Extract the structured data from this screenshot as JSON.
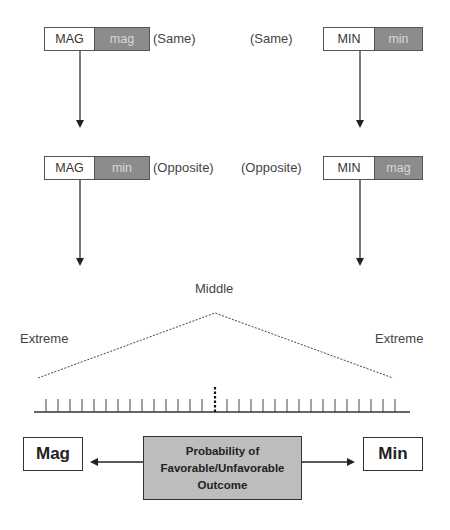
{
  "row1": {
    "left": {
      "upper": "MAG",
      "lower": "mag",
      "relation": "(Same)"
    },
    "right": {
      "upper": "MIN",
      "lower": "min",
      "relation": "(Same)"
    }
  },
  "row2": {
    "left": {
      "upper": "MAG",
      "lower": "min",
      "relation": "(Opposite)"
    },
    "right": {
      "upper": "MIN",
      "lower": "mag",
      "relation": "(Opposite)"
    }
  },
  "scale": {
    "middle_label": "Middle",
    "left_label": "Extreme",
    "right_label": "Extreme",
    "tick_count_left": 14,
    "tick_count_right": 15
  },
  "bottom": {
    "left_box": "Mag",
    "right_box": "Min",
    "center_line1": "Probability of",
    "center_line2": "Favorable/Unfavorable",
    "center_line3": "Outcome"
  },
  "colors": {
    "grey_cell": "#8c8c8c",
    "center_box": "#bdbdbd",
    "line": "#333333"
  }
}
